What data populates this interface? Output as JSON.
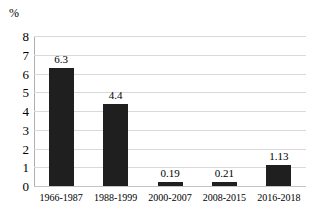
{
  "chart_data": {
    "type": "bar",
    "title": "",
    "subtitle": "",
    "xlabel": "",
    "ylabel": "%",
    "categories": [
      "1966-1987",
      "1988-1999",
      "2000-2007",
      "2008-2015",
      "2016-2018"
    ],
    "values": [
      6.3,
      4.4,
      0.19,
      0.21,
      1.13
    ],
    "value_labels": [
      "6.3",
      "4.4",
      "0.19",
      "0.21",
      "1.13"
    ],
    "series": [
      {
        "name": "",
        "values": [
          6.3,
          4.4,
          0.19,
          0.21,
          1.13
        ]
      }
    ],
    "ylim": [
      0,
      8
    ],
    "yticks": [
      0,
      1,
      2,
      3,
      4,
      5,
      6,
      7,
      8
    ],
    "ytick_labels": [
      "0",
      "1",
      "2",
      "3",
      "4",
      "5",
      "6",
      "7",
      "8"
    ],
    "grid": "horizontal",
    "legend": "none",
    "bar_color": "#1f1f1f",
    "gridline_color": "#d9d9d9",
    "axis_color": "#b0b0b0",
    "background_color": "#ffffff"
  }
}
